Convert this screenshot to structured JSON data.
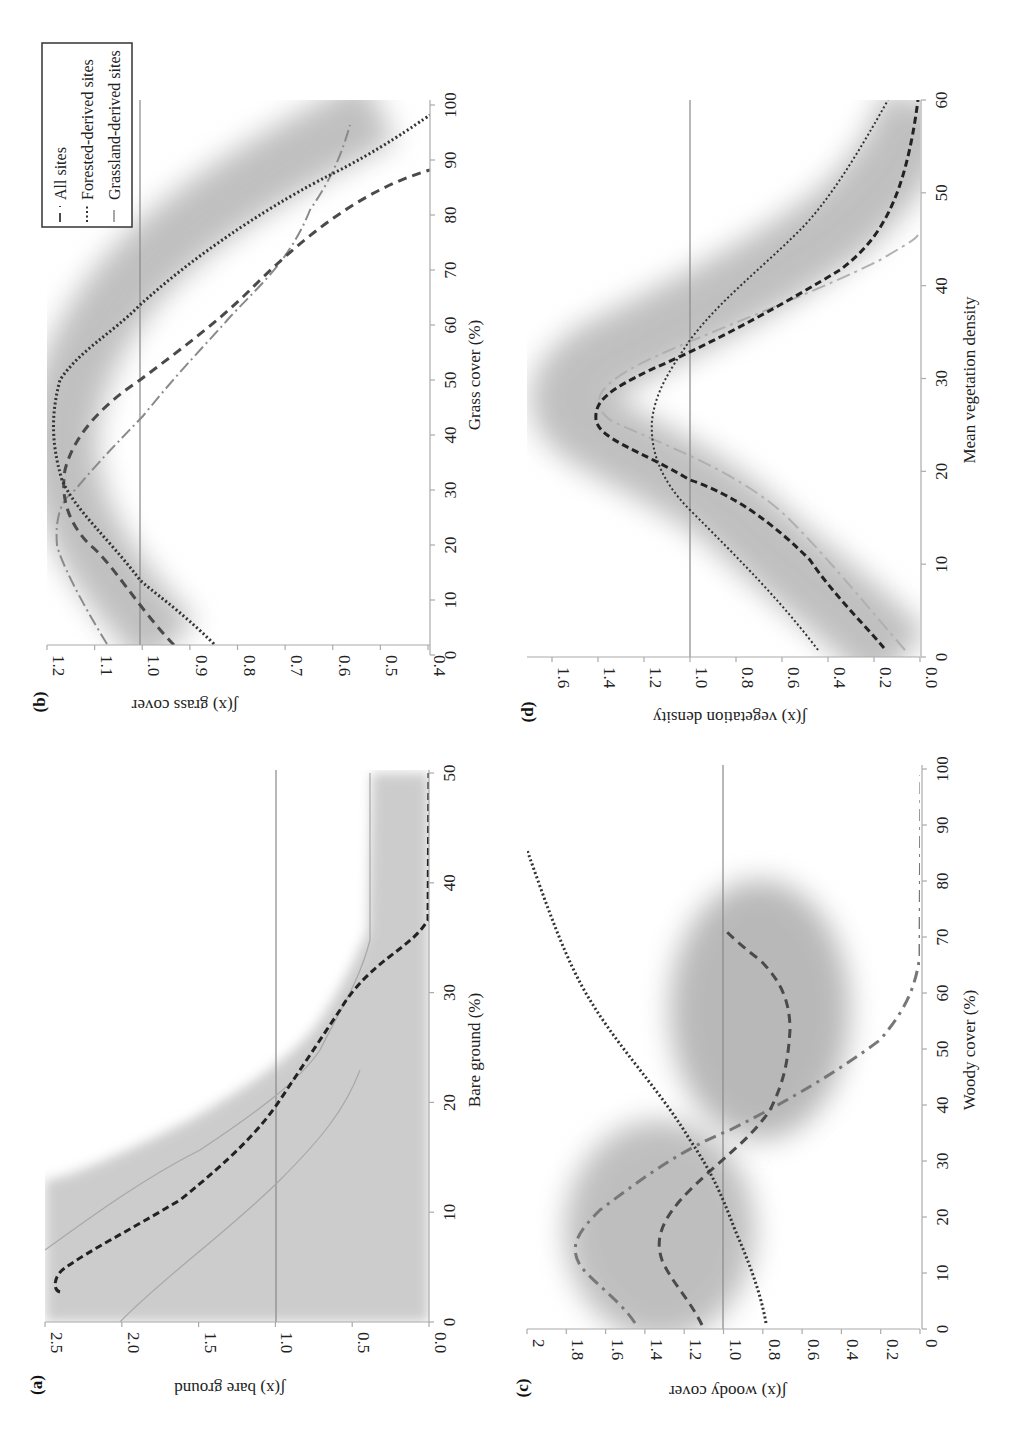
{
  "figure": {
    "panels": {
      "a": {
        "label": "(a)",
        "ylabel": "ʃ(x) bare ground",
        "xlabel": "Bare ground (%)",
        "y_ticks": [
          "2.5",
          "2.0",
          "1.5",
          "1.0",
          "0.5",
          "0.0"
        ],
        "x_ticks": [
          "0",
          "10",
          "20",
          "30",
          "40",
          "50"
        ]
      },
      "b": {
        "label": "(b)",
        "ylabel": "ʃ(x) grass cover",
        "xlabel": "Grass cover (%)",
        "y_ticks": [
          "1.2",
          "1.1",
          "1.0",
          "0.9",
          "0.8",
          "0.7",
          "0.6",
          "0.5",
          "0.4"
        ],
        "x_ticks": [
          "0",
          "10",
          "20",
          "30",
          "40",
          "50",
          "60",
          "70",
          "80",
          "90",
          "100"
        ]
      },
      "c": {
        "label": "(c)",
        "ylabel": "ʃ(x) woody cover",
        "xlabel": "Woody cover (%)",
        "y_ticks": [
          "2",
          "1.8",
          "1.6",
          "1.4",
          "1.2",
          "1.0",
          "0.8",
          "0.6",
          "0.4",
          "0.2",
          "0"
        ],
        "x_ticks": [
          "0",
          "10",
          "20",
          "30",
          "40",
          "50",
          "60",
          "70",
          "80",
          "90",
          "100"
        ]
      },
      "d": {
        "label": "(d)",
        "ylabel": "ʃ(x) vegetation density",
        "xlabel": "Mean vegetation density",
        "y_ticks": [
          "1.6",
          "1.4",
          "1.2",
          "1.0",
          "0.8",
          "0.6",
          "0.4",
          "0.2",
          "0.0"
        ],
        "x_ticks": [
          "0",
          "10",
          "20",
          "30",
          "40",
          "50",
          "60"
        ]
      }
    },
    "legend": {
      "items": [
        {
          "label": "All sites",
          "style": "dashed"
        },
        {
          "label": "Forested-derived sites",
          "style": "dotted"
        },
        {
          "label": "Grassland-derived sites",
          "style": "dash-dot"
        }
      ]
    },
    "colors": {
      "band": "#9a9a9a",
      "all_sites": "#4a4a4a",
      "forested": "#333333",
      "grassland": "#8a8a8a",
      "reference": "#888888"
    }
  },
  "chart_data": [
    {
      "type": "line",
      "title": "(a)",
      "xlabel": "Bare ground (%)",
      "ylabel": "ʃ(x) bare ground",
      "xlim": [
        0,
        50
      ],
      "ylim": [
        0,
        2.5
      ],
      "reference_line": 1.0,
      "grid": false,
      "x": [
        1,
        2,
        3,
        4,
        5,
        6,
        7,
        8,
        9,
        10,
        12,
        14,
        16,
        18,
        20,
        25,
        30,
        40,
        50
      ],
      "series": [
        {
          "name": "All sites",
          "values": [
            2.38,
            2.42,
            2.4,
            2.25,
            2.0,
            1.7,
            1.38,
            1.08,
            0.82,
            0.6,
            0.3,
            0.12,
            0.04,
            0.01,
            0.0,
            0.0,
            0.0,
            0.0,
            0.0
          ]
        }
      ],
      "band": {
        "upper_plateau": 0.38,
        "description": "95% CI band around All sites curve"
      }
    },
    {
      "type": "line",
      "title": "(b)",
      "xlabel": "Grass cover (%)",
      "ylabel": "ʃ(x) grass cover",
      "xlim": [
        0,
        100
      ],
      "ylim": [
        0.4,
        1.2
      ],
      "reference_line": 1.0,
      "grid": false,
      "legend_position": "upper-left",
      "x": [
        2,
        10,
        20,
        30,
        40,
        50,
        60,
        70,
        80,
        90,
        97
      ],
      "series": [
        {
          "name": "All sites",
          "values": [
            0.93,
            1.07,
            1.16,
            1.17,
            1.12,
            1.0,
            0.86,
            0.72,
            0.56,
            0.4,
            null
          ]
        },
        {
          "name": "Forested-derived sites",
          "values": [
            0.85,
            0.93,
            1.05,
            1.16,
            1.2,
            1.19,
            1.08,
            0.86,
            0.65,
            0.48,
            0.4
          ]
        },
        {
          "name": "Grassland-derived sites",
          "values": [
            1.07,
            1.17,
            1.18,
            1.12,
            0.98,
            0.85,
            0.73,
            0.62,
            0.55,
            0.51,
            0.48
          ]
        }
      ]
    },
    {
      "type": "line",
      "title": "(c)",
      "xlabel": "Woody cover (%)",
      "ylabel": "ʃ(x) woody cover",
      "xlim": [
        0,
        100
      ],
      "ylim": [
        0,
        2
      ],
      "reference_line": 1.0,
      "grid": false,
      "x": [
        1,
        5,
        10,
        15,
        20,
        25,
        30,
        35,
        40,
        45,
        50,
        55,
        60,
        62,
        65,
        70,
        80,
        90,
        100
      ],
      "series": [
        {
          "name": "All sites",
          "values": [
            1.12,
            1.25,
            1.32,
            1.32,
            1.27,
            1.16,
            1.02,
            0.91,
            0.83,
            0.79,
            0.78,
            0.8,
            0.9,
            0.97,
            null,
            null,
            null,
            null,
            null
          ]
        },
        {
          "name": "Forested-derived sites",
          "values": [
            0.78,
            0.8,
            0.83,
            0.87,
            0.92,
            0.97,
            1.03,
            1.12,
            1.24,
            1.38,
            1.55,
            1.72,
            1.88,
            1.95,
            2.0,
            null,
            null,
            null,
            null
          ]
        },
        {
          "name": "Grassland-derived sites",
          "values": [
            1.45,
            1.62,
            1.77,
            1.75,
            1.55,
            1.2,
            0.98,
            0.72,
            0.48,
            0.27,
            0.13,
            0.05,
            0.02,
            0.01,
            0.0,
            0.0,
            0.0,
            0.0,
            0.0
          ]
        }
      ]
    },
    {
      "type": "line",
      "title": "(d)",
      "xlabel": "Mean vegetation density",
      "ylabel": "ʃ(x) vegetation density",
      "xlim": [
        0,
        60
      ],
      "ylim": [
        0,
        1.7
      ],
      "reference_line": 1.0,
      "grid": false,
      "x": [
        1,
        5,
        10,
        13,
        15,
        20,
        23,
        25,
        30,
        35,
        40,
        45,
        50,
        55,
        60
      ],
      "series": [
        {
          "name": "All sites",
          "values": [
            0.15,
            0.32,
            0.65,
            0.9,
            1.05,
            1.38,
            1.41,
            1.38,
            1.14,
            0.7,
            0.35,
            0.14,
            0.05,
            0.02,
            0.0
          ]
        },
        {
          "name": "Forested-derived sites",
          "values": [
            0.44,
            0.57,
            0.78,
            0.92,
            1.0,
            1.12,
            1.16,
            1.16,
            1.12,
            1.0,
            0.8,
            0.58,
            0.35,
            0.2,
            0.12
          ]
        },
        {
          "name": "Grassland-derived sites",
          "values": [
            0.08,
            0.2,
            0.55,
            0.9,
            1.08,
            1.32,
            1.25,
            1.0,
            0.45,
            0.12,
            0.02,
            null,
            null,
            null,
            null
          ]
        }
      ]
    }
  ]
}
